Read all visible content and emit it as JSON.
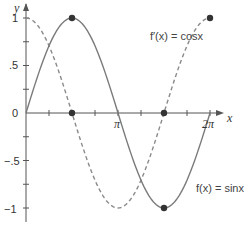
{
  "chart_data": {
    "type": "line",
    "title": "",
    "xlabel": "x",
    "ylabel": "y",
    "xlim": [
      0,
      6.2832
    ],
    "ylim": [
      -1.1,
      1.1
    ],
    "x_ticks": [
      {
        "value": 0.7854,
        "label": ""
      },
      {
        "value": 1.5708,
        "label": ""
      },
      {
        "value": 2.3562,
        "label": ""
      },
      {
        "value": 3.1416,
        "label": "π"
      },
      {
        "value": 3.927,
        "label": ""
      },
      {
        "value": 4.7124,
        "label": ""
      },
      {
        "value": 5.4978,
        "label": ""
      },
      {
        "value": 6.2832,
        "label": "2π"
      }
    ],
    "y_ticks": [
      {
        "value": 1,
        "label": "1"
      },
      {
        "value": 0.75,
        "label": ""
      },
      {
        "value": 0.5,
        "label": ".5"
      },
      {
        "value": 0.25,
        "label": ""
      },
      {
        "value": 0,
        "label": "0"
      },
      {
        "value": -0.25,
        "label": ""
      },
      {
        "value": -0.5,
        "label": "−.5"
      },
      {
        "value": -0.75,
        "label": ""
      },
      {
        "value": -1,
        "label": "−1"
      }
    ],
    "grid": false,
    "series": [
      {
        "name": "f(x) = sinx",
        "style": "solid",
        "function": "sin",
        "x": [
          0,
          0.7854,
          1.5708,
          2.3562,
          3.1416,
          3.927,
          4.7124,
          5.4978,
          6.2832
        ],
        "values": [
          0,
          0.707,
          1,
          0.707,
          0,
          -0.707,
          -1,
          -0.707,
          0
        ],
        "marked_points": [
          [
            1.5708,
            1
          ],
          [
            4.7124,
            -1
          ]
        ]
      },
      {
        "name": "f′(x) = cosx",
        "style": "dashed",
        "function": "cos",
        "x": [
          0,
          0.7854,
          1.5708,
          2.3562,
          3.1416,
          3.927,
          4.7124,
          5.4978,
          6.2832
        ],
        "values": [
          1,
          0.707,
          0,
          -0.707,
          -1,
          -0.707,
          0,
          0.707,
          1
        ],
        "marked_points": [
          [
            1.5708,
            0
          ],
          [
            4.7124,
            0
          ],
          [
            6.2832,
            1
          ]
        ]
      }
    ],
    "annotations": [
      {
        "text": "f′(x) = cosx",
        "near_series": "cos"
      },
      {
        "text": "f(x) = sinx",
        "near_series": "sin"
      }
    ]
  },
  "labels": {
    "x_axis": "x",
    "y_axis": "y",
    "cos_label": "f′(x) = cosx",
    "sin_label": "f(x) = sinx",
    "pi": "π",
    "two_pi": "2π",
    "y1": "1",
    "y05": ".5",
    "y0": "0",
    "yn05": "−.5",
    "yn1": "−1"
  },
  "colors": {
    "axis": "#555555",
    "sin_curve": "#7a7a7a",
    "cos_curve": "#8a8a8a",
    "point": "#333333"
  }
}
